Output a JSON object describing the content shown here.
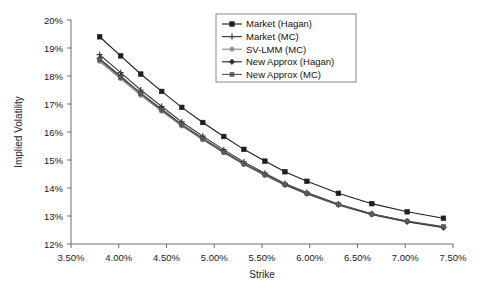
{
  "chart_data": {
    "type": "line",
    "title": "",
    "xlabel": "Strike",
    "ylabel": "Implied Volatility",
    "xlim": [
      0.035,
      0.075
    ],
    "ylim": [
      0.12,
      0.2
    ],
    "grid": false,
    "legend_position": "upper-right",
    "x_tick_labels": [
      "3.50%",
      "4.00%",
      "4.50%",
      "5.00%",
      "5.50%",
      "6.00%",
      "6.50%",
      "7.00%",
      "7.50%"
    ],
    "x_tick_values": [
      0.035,
      0.04,
      0.045,
      0.05,
      0.055,
      0.06,
      0.065,
      0.07,
      0.075
    ],
    "y_tick_labels": [
      "12%",
      "13%",
      "14%",
      "15%",
      "16%",
      "17%",
      "18%",
      "19%",
      "20%"
    ],
    "y_tick_values": [
      0.12,
      0.13,
      0.14,
      0.15,
      0.16,
      0.17,
      0.18,
      0.19,
      0.2
    ],
    "x": [
      0.038,
      0.0402,
      0.0423,
      0.0445,
      0.0466,
      0.0488,
      0.051,
      0.0531,
      0.0553,
      0.0574,
      0.0597,
      0.063,
      0.0665,
      0.0702,
      0.074
    ],
    "series": [
      {
        "name": "Market (Hagan)",
        "marker": "square-filled",
        "color": "#1f1f1f",
        "values": [
          0.194,
          0.1872,
          0.1807,
          0.1745,
          0.1688,
          0.1634,
          0.1584,
          0.1538,
          0.1496,
          0.1458,
          0.1424,
          0.1381,
          0.1344,
          0.1315,
          0.1292
        ]
      },
      {
        "name": "Market (MC)",
        "marker": "plus",
        "color": "#3d3d3d",
        "values": [
          0.1876,
          0.1812,
          0.175,
          0.1691,
          0.1636,
          0.1585,
          0.1537,
          0.1493,
          0.1453,
          0.1416,
          0.1384,
          0.1343,
          0.1308,
          0.1281,
          0.126
        ]
      },
      {
        "name": "SV-LMM (MC)",
        "marker": "circle",
        "color": "#8e8e8e",
        "values": [
          0.1852,
          0.179,
          0.1731,
          0.1674,
          0.1621,
          0.1572,
          0.1526,
          0.1484,
          0.1445,
          0.141,
          0.1379,
          0.1339,
          0.1305,
          0.1279,
          0.1258
        ]
      },
      {
        "name": "New Approx (Hagan)",
        "marker": "diamond-filled",
        "color": "#2b2b2b",
        "values": [
          0.1862,
          0.1799,
          0.1739,
          0.1681,
          0.1627,
          0.1577,
          0.153,
          0.1487,
          0.1448,
          0.1412,
          0.138,
          0.134,
          0.1306,
          0.128,
          0.1259
        ]
      },
      {
        "name": "New Approx (MC)",
        "marker": "square-small",
        "color": "#5a5a5a",
        "values": [
          0.1858,
          0.1795,
          0.1736,
          0.1678,
          0.1625,
          0.1575,
          0.1528,
          0.1486,
          0.1447,
          0.1412,
          0.1381,
          0.1341,
          0.1307,
          0.1282,
          0.1262
        ]
      }
    ]
  }
}
